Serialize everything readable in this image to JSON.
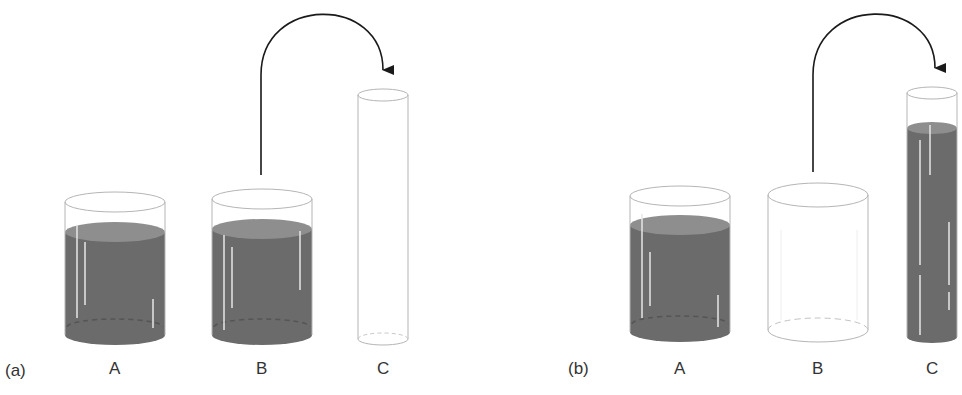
{
  "colors": {
    "liquid": "#6b6b6b",
    "liquid_surface": "#8e8e8e",
    "outline": "#b5b5b5",
    "arrow": "#1a1a1a",
    "text": "#333333"
  },
  "panels": [
    {
      "id": "a",
      "label": "(a)",
      "containers": [
        {
          "name": "A",
          "label": "A",
          "shape": "wide-beaker",
          "filled": true
        },
        {
          "name": "B",
          "label": "B",
          "shape": "wide-beaker",
          "filled": true
        },
        {
          "name": "C",
          "label": "C",
          "shape": "narrow-tube",
          "filled": false
        }
      ],
      "arrow": {
        "from": "B",
        "to": "C",
        "meaning": "pour liquid from B into C"
      }
    },
    {
      "id": "b",
      "label": "(b)",
      "containers": [
        {
          "name": "A",
          "label": "A",
          "shape": "wide-beaker",
          "filled": true
        },
        {
          "name": "B",
          "label": "B",
          "shape": "wide-beaker",
          "filled": false
        },
        {
          "name": "C",
          "label": "C",
          "shape": "narrow-tube",
          "filled": true
        }
      ],
      "arrow": {
        "from": "B",
        "to": "C",
        "meaning": "liquid poured from B into C"
      }
    }
  ]
}
